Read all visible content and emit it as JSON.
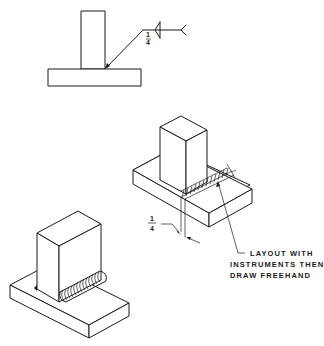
{
  "figure": {
    "type": "technical-drawing",
    "background": "#ffffff",
    "line_color": "#1a1a1a"
  },
  "orthographic_view": {
    "weld_symbol": {
      "size_numerator": "1",
      "size_denominator": "4",
      "symbol": "fillet-weld-both-sides",
      "tail": "tail-icon"
    }
  },
  "isometric_layout_view": {
    "dimension": {
      "numerator": "1",
      "denominator": "4"
    },
    "note_lines": [
      "LAYOUT WITH",
      "INSTRUMENTS THEN",
      "DRAW FREEHAND"
    ]
  },
  "isometric_finished_view": {
    "weld_bead": "freehand-ripple-bead"
  }
}
